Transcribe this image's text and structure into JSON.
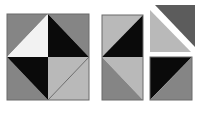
{
  "colors": {
    "background": "#ffffff",
    "white": "#f2f2f2",
    "light": "#b9b9b9",
    "medium": "#858585",
    "dark": "#5c5c5c",
    "black": "#0a0a0a",
    "outline": "#6a6a6a"
  },
  "figures": [
    {
      "name": "assembled-square",
      "outline": {
        "x": 7,
        "y": 14,
        "w": 82,
        "h": 86
      },
      "polygons": [
        {
          "name": "top-left-corner-triangle",
          "fill": "medium",
          "points": "7,14 48,14 7,57"
        },
        {
          "name": "top-right-corner-triangle",
          "fill": "medium",
          "points": "48,14 89,14 89,57"
        },
        {
          "name": "bottom-left-corner-triangle",
          "fill": "medium",
          "points": "7,57 7,100 48,100"
        },
        {
          "name": "bottom-right-corner-triangle",
          "fill": "light",
          "points": "89,57 89,100 48,100"
        },
        {
          "name": "upper-left-white-triangle",
          "fill": "white",
          "points": "48,14 48,57 7,57"
        },
        {
          "name": "upper-right-black-triangle",
          "fill": "black",
          "points": "48,14 89,57 48,57"
        },
        {
          "name": "lower-left-black-triangle",
          "fill": "black",
          "points": "7,57 48,57 48,100"
        },
        {
          "name": "lower-right-light-triangle",
          "fill": "light",
          "points": "48,57 89,57 48,100"
        }
      ],
      "lines": [
        {
          "name": "inner-diagonal",
          "x1": 89,
          "y1": 57,
          "x2": 48,
          "y2": 100
        }
      ]
    },
    {
      "name": "middle-column",
      "outline": {
        "x": 102,
        "y": 15,
        "w": 41,
        "h": 85
      },
      "polygons": [
        {
          "name": "top-light-triangle",
          "fill": "light",
          "points": "102,15 143,15 102,57"
        },
        {
          "name": "top-black-triangle",
          "fill": "black",
          "points": "143,15 143,57 102,57"
        },
        {
          "name": "bottom-light-triangle",
          "fill": "light",
          "points": "102,57 143,57 143,100"
        },
        {
          "name": "bottom-medium-triangle",
          "fill": "medium",
          "points": "102,57 143,100 102,100"
        }
      ],
      "lines": []
    },
    {
      "name": "top-right-separated-pieces",
      "outline": null,
      "polygons": [
        {
          "name": "dark-gray-triangle",
          "fill": "dark",
          "points": "155,5 195,5 195,47"
        },
        {
          "name": "light-gray-triangle",
          "fill": "light",
          "points": "150,10 150,52 191,52"
        }
      ],
      "lines": []
    },
    {
      "name": "bottom-right-square",
      "outline": {
        "x": 150,
        "y": 57,
        "w": 42,
        "h": 43
      },
      "polygons": [
        {
          "name": "black-triangle",
          "fill": "black",
          "points": "150,57 192,57 150,100"
        },
        {
          "name": "medium-triangle",
          "fill": "medium",
          "points": "192,57 192,100 150,100"
        }
      ],
      "lines": []
    }
  ]
}
